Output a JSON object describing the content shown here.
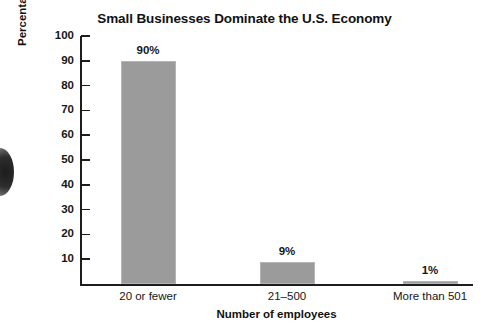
{
  "chart_data": {
    "type": "bar",
    "title": "Small Businesses Dominate the U.S. Economy",
    "xlabel": "Number of employees",
    "ylabel": "Percentage of all U.S. businesses",
    "categories": [
      "20 or fewer",
      "21–500",
      "More than 501"
    ],
    "values": [
      90,
      9,
      1
    ],
    "value_labels": [
      "90%",
      "9%",
      "1%"
    ],
    "ylim": [
      0,
      100
    ],
    "yticks": [
      100,
      90,
      80,
      70,
      60,
      50,
      40,
      30,
      20,
      10
    ],
    "ytick_labels": [
      "100",
      "90",
      "80",
      "70",
      "60",
      "50",
      "40",
      "30",
      "20",
      "10"
    ],
    "grid": false,
    "legend": null,
    "bar_color": "#9b9b9b",
    "axis_color": "#1d1d1d",
    "background": "#ffffff"
  }
}
